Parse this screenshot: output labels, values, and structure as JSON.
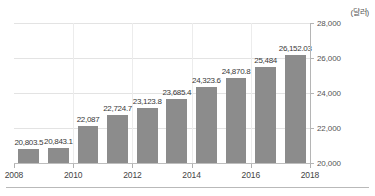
{
  "chart_data": {
    "type": "bar",
    "title": "",
    "subtitle": "",
    "unit_label": "(달러)",
    "xlabel": "",
    "ylabel": "",
    "ylim": [
      20000,
      28000
    ],
    "ytick_values": [
      20000,
      22000,
      24000,
      26000,
      28000
    ],
    "ytick_labels": [
      "20,000",
      "22,000",
      "24,000",
      "26,000",
      "28,000"
    ],
    "xtick_labels": [
      "2008",
      "2010",
      "2012",
      "2014",
      "2016",
      "2018"
    ],
    "grid": true,
    "legend": "none",
    "categories": [
      2008,
      2009,
      2010,
      2011,
      2012,
      2013,
      2014,
      2015,
      2016,
      2017
    ],
    "values": [
      20803.5,
      20843.1,
      22087,
      22724.7,
      23123.8,
      23685.4,
      24323.6,
      24870.8,
      25484,
      26152.03
    ],
    "value_labels": [
      "20,803.5",
      "20,843.1",
      "22,087",
      "22,724.7",
      "23,123.8",
      "23,685.4",
      "24,323.6",
      "24,870.8",
      "25,484",
      "26,152.03"
    ],
    "bar_color": "#8c8c8c",
    "gridline_color": "#e3e3e3",
    "axis_color": "#b5b5b5",
    "text_color": "#444444",
    "background": "#ffffff"
  }
}
